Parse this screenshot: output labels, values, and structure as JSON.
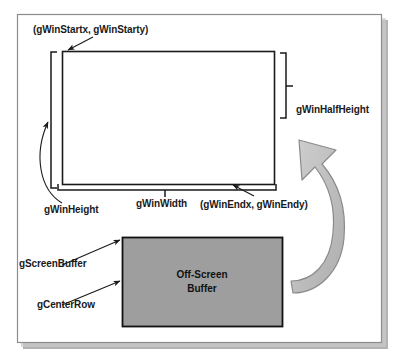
{
  "diagram": {
    "colors": {
      "frame_border": "#8c8c8c",
      "line": "#1a1a1a",
      "buffer_fill": "#9e9e9e",
      "buffer_border": "#111111",
      "arrow_fill": "#bdbdbd",
      "arrow_border": "#8a8a8a",
      "shadow": "#a8a8a8",
      "background": "#ffffff",
      "text": "#1a1a1a"
    },
    "labels": {
      "start_coords": "(gWinStartx, gWinStarty)",
      "end_coords": "(gWinEndx, gWinEndy)",
      "half_height": "gWinHalfHeight",
      "height": "gWinHeight",
      "width": "gWinWidth",
      "screen_buffer": "gScreenBuffer",
      "center_row": "gCenterRow",
      "buffer_line1": "Off-Screen",
      "buffer_line2": "Buffer"
    },
    "shapes": {
      "outer_frame": {
        "x": 17,
        "y": 14,
        "width": 365,
        "height": 329
      },
      "window_rect": {
        "x": 62,
        "y": 51,
        "width": 213,
        "height": 134
      },
      "buffer_rect": {
        "x": 122,
        "y": 237,
        "width": 161,
        "height": 90
      },
      "height_bracket": {
        "x": 51,
        "y_top": 52,
        "y_bottom": 188
      },
      "half_height_bracket": {
        "x": 286,
        "y_top": 53,
        "y_bottom": 118
      },
      "width_bracket": {
        "y": 190,
        "x_left": 58,
        "x_right": 276
      },
      "curved_arrow": {
        "points_to": "window_rect",
        "origin": "buffer_rect"
      }
    }
  }
}
